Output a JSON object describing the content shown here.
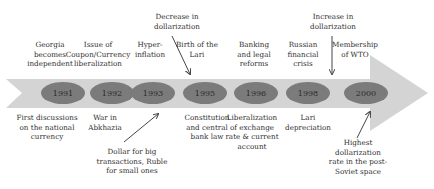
{
  "timeline": {
    "colors": {
      "band": "#d4d4d4",
      "oval": "#7b7b7b",
      "text": "#2f2f2f",
      "arrow": "#444444"
    },
    "years": [
      "1991",
      "1992",
      "1993",
      "1995",
      "1996",
      "1998",
      "2000"
    ],
    "above": [
      "Georgia\nbecomes\nindependent",
      "Issue of\nCoupon/Currency\nliberalization",
      "Hyper-\ninflation",
      "Birth of the\nLari",
      "Banking\nand legal\nreforms",
      "Russian\nfinancial\ncrisis",
      "Membership\nof WTO"
    ],
    "below": [
      "First discussions\non the national\ncurrency",
      "War in\nAbkhazia",
      "Constitution\nand central\nbank law",
      "Liberalization\nof exchange\nrate & current\naccount",
      "Lari\ndepreciation"
    ],
    "annotations": {
      "decrease": "Decrease in\ndollarization",
      "increase": "Increase in\ndollarization",
      "dollar_ruble": "Dollar for big\ntransactions, Ruble\nfor small ones",
      "highest": "Highest\ndollarization\nrate in the post-\nSoviet space"
    }
  }
}
